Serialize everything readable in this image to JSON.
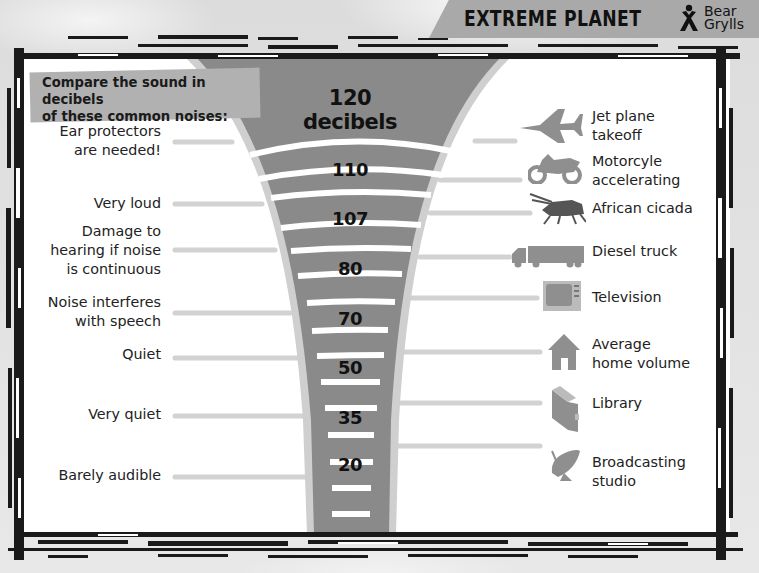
{
  "header": {
    "title": "EXTREME PLANET",
    "brand_line1": "Bear",
    "brand_line2": "Grylls"
  },
  "intro": {
    "line1": "Compare the sound in decibels",
    "line2": "of these common noises:"
  },
  "scale": {
    "top_value": "120",
    "top_unit": "decibels",
    "values": [
      "110",
      "107",
      "80",
      "70",
      "50",
      "35",
      "20"
    ]
  },
  "left_labels": [
    {
      "line1": "Ear protectors",
      "line2": "are needed!"
    },
    {
      "line1": "Very loud"
    },
    {
      "line1": "Damage to",
      "line2": "hearing if noise",
      "line3": "is continuous"
    },
    {
      "line1": "Noise interferes",
      "line2": "with speech"
    },
    {
      "line1": "Quiet"
    },
    {
      "line1": "Very quiet"
    },
    {
      "line1": "Barely audible"
    }
  ],
  "right_labels": [
    {
      "icon": "jet-plane-icon",
      "line1": "Jet plane",
      "line2": "takeoff"
    },
    {
      "icon": "motorcycle-icon",
      "line1": "Motorcyle",
      "line2": "accelerating"
    },
    {
      "icon": "cicada-icon",
      "line1": "African cicada"
    },
    {
      "icon": "truck-icon",
      "line1": "Diesel truck"
    },
    {
      "icon": "television-icon",
      "line1": "Television"
    },
    {
      "icon": "house-icon",
      "line1": "Average",
      "line2": "home volume"
    },
    {
      "icon": "book-icon",
      "line1": "Library"
    },
    {
      "icon": "satellite-dish-icon",
      "line1": "Broadcasting",
      "line2": "studio"
    }
  ],
  "colors": {
    "funnel_fill": "#8a8a8a",
    "funnel_rim": "#cfcfcf",
    "connector": "#d2d2d2",
    "icon_gray": "#8f8f8f",
    "header_band": "#a9a9a9",
    "intro_box": "#b1b1b1"
  }
}
